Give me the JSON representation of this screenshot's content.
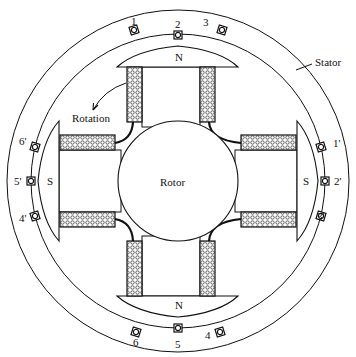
{
  "diagram": {
    "labels": {
      "stator": "Stator",
      "rotor": "Rotor",
      "rotation": "Rotation"
    },
    "poles": {
      "top": "N",
      "bottom": "N",
      "left": "S",
      "right": "S"
    },
    "slots": {
      "top": [
        "1",
        "2",
        "3"
      ],
      "bottom": [
        "6",
        "5",
        "4"
      ],
      "left": [
        "6'",
        "5'",
        "4'"
      ],
      "right": [
        "1'",
        "2'",
        "3'"
      ]
    },
    "colors": {
      "line": "#111111",
      "background": "#ffffff",
      "coil_fill": "#e8e8e8"
    }
  }
}
